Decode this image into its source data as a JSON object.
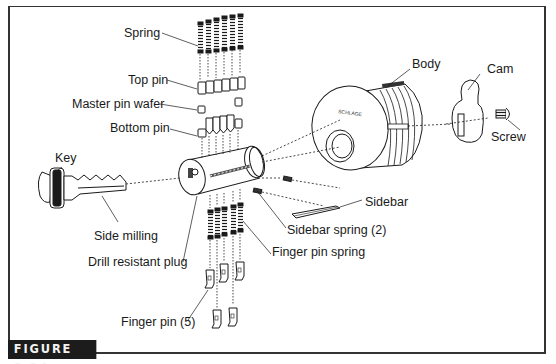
{
  "figure": {
    "caption": "FIGURE 8.24",
    "brand_on_body": "SCHLAGE",
    "brand_on_key": "SCHLAGE"
  },
  "labels": {
    "spring": "Spring",
    "top_pin": "Top pin",
    "master_pin_wafer": "Master pin wafer",
    "bottom_pin": "Bottom pin",
    "key": "Key",
    "side_milling": "Side milling",
    "drill_resistant_plug": "Drill resistant plug",
    "finger_pin": "Finger pin (5)",
    "finger_pin_spring": "Finger pin  spring",
    "sidebar_spring": "Sidebar spring (2)",
    "sidebar": "Sidebar",
    "body": "Body",
    "cam": "Cam",
    "screw": "Screw"
  },
  "colors": {
    "ink": "#1a1a1a",
    "frame": "#333333",
    "badge_bg": "#1c1c1c",
    "badge_text": "#f2f2f2",
    "paper": "#ffffff"
  }
}
